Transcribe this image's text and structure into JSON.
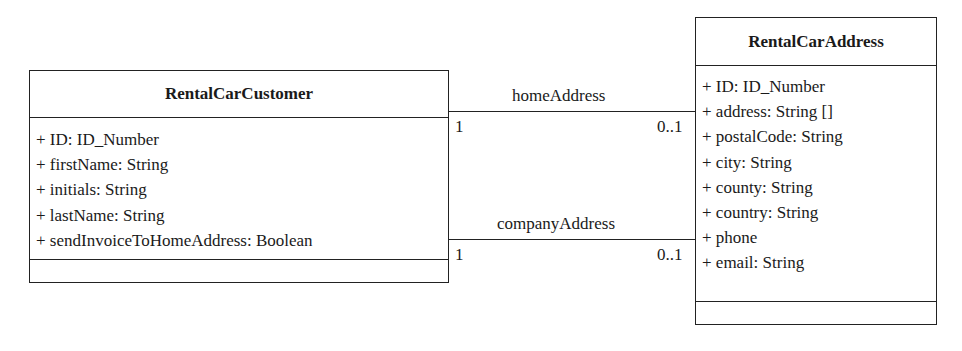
{
  "diagram": {
    "type": "UML class diagram",
    "classes": [
      {
        "name": "RentalCarCustomer",
        "attributes": [
          "+ ID: ID_Number",
          "+ firstName: String",
          "+ initials: String",
          "+ lastName: String",
          "+ sendInvoiceToHomeAddress: Boolean"
        ],
        "operations": []
      },
      {
        "name": "RentalCarAddress",
        "attributes": [
          "+ ID: ID_Number",
          "+ address: String []",
          "+ postalCode: String",
          "+ city: String",
          "+ county: String",
          "+ country: String",
          "+ phone",
          "+ email: String"
        ],
        "operations": []
      }
    ],
    "associations": [
      {
        "name": "homeAddress",
        "from": "RentalCarCustomer",
        "to": "RentalCarAddress",
        "from_multiplicity": "1",
        "to_multiplicity": "0..1"
      },
      {
        "name": "companyAddress",
        "from": "RentalCarCustomer",
        "to": "RentalCarAddress",
        "from_multiplicity": "1",
        "to_multiplicity": "0..1"
      }
    ]
  }
}
